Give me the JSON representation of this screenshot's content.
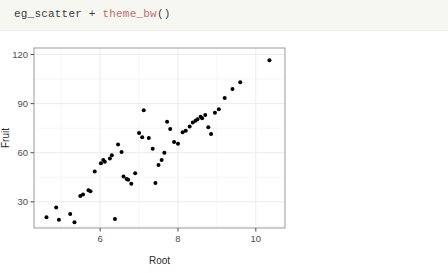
{
  "code_cell": {
    "object_name": "eg_scatter",
    "operator": "+",
    "function_call": "theme_bw",
    "parens": "()",
    "full_text": "eg_scatter + theme_bw()",
    "function_color": "#c26b6b",
    "background_color": "#f7f7f2",
    "text_color": "#3b3b3b"
  },
  "chart_data": {
    "type": "scatter",
    "title": "",
    "subtitle": "",
    "xlabel": "Root",
    "ylabel": "Fruit",
    "xlim": [
      4.3,
      10.75
    ],
    "ylim": [
      14,
      124
    ],
    "xticks": [
      6,
      8,
      10
    ],
    "xticklabels": [
      "6",
      "8",
      "10"
    ],
    "yticks": [
      30,
      60,
      90,
      120
    ],
    "yticklabels": [
      "30",
      "60",
      "90",
      "120"
    ],
    "grid": true,
    "grid_major_color": "#ebebeb",
    "grid_minor_color": "#f4f4f4",
    "panel_border_color": "#9a9a9a",
    "panel_background": "#ffffff",
    "legend": "none",
    "point_color": "#000000",
    "point_size": 3.1,
    "theme": "theme_bw",
    "x": [
      4.62,
      4.87,
      4.94,
      5.23,
      5.34,
      5.49,
      5.56,
      5.7,
      5.75,
      5.86,
      6.02,
      6.08,
      6.12,
      6.25,
      6.3,
      6.38,
      6.46,
      6.55,
      6.6,
      6.68,
      6.72,
      6.8,
      6.9,
      7.0,
      7.08,
      7.12,
      7.25,
      7.35,
      7.42,
      7.5,
      7.58,
      7.65,
      7.72,
      7.8,
      7.9,
      8.0,
      8.12,
      8.2,
      8.3,
      8.38,
      8.45,
      8.5,
      8.58,
      8.62,
      8.7,
      8.78,
      8.85,
      8.95,
      9.05,
      9.2,
      9.4,
      9.6,
      10.35
    ],
    "y": [
      20.5,
      26.5,
      19.0,
      22.5,
      17.5,
      33.5,
      34.5,
      37.0,
      36.5,
      48.5,
      53.5,
      55.5,
      54.5,
      56.5,
      58.5,
      19.5,
      65.0,
      60.5,
      45.5,
      44.0,
      43.5,
      41.0,
      47.5,
      72.0,
      69.5,
      86.0,
      69.0,
      62.5,
      41.5,
      52.5,
      55.5,
      60.0,
      79.0,
      74.5,
      66.5,
      65.5,
      72.5,
      73.5,
      76.0,
      78.5,
      79.5,
      80.5,
      82.0,
      81.0,
      83.0,
      75.5,
      71.5,
      84.5,
      86.5,
      93.5,
      99.0,
      103.0,
      116.5
    ]
  }
}
